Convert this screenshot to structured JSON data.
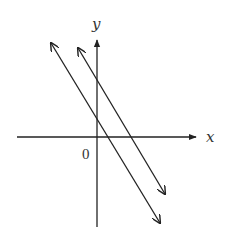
{
  "diagram": {
    "title": "",
    "axes": {
      "x_label": "x",
      "y_label": "y",
      "origin_label": "0"
    },
    "lines": [
      {
        "name": "lower-line",
        "description": "decreasing line with positive y-intercept, crosses x-axis just right of origin"
      },
      {
        "name": "upper-line",
        "description": "parallel decreasing line with larger y-intercept"
      }
    ],
    "colors": {
      "stroke": "#222222",
      "background": "#ffffff"
    }
  }
}
